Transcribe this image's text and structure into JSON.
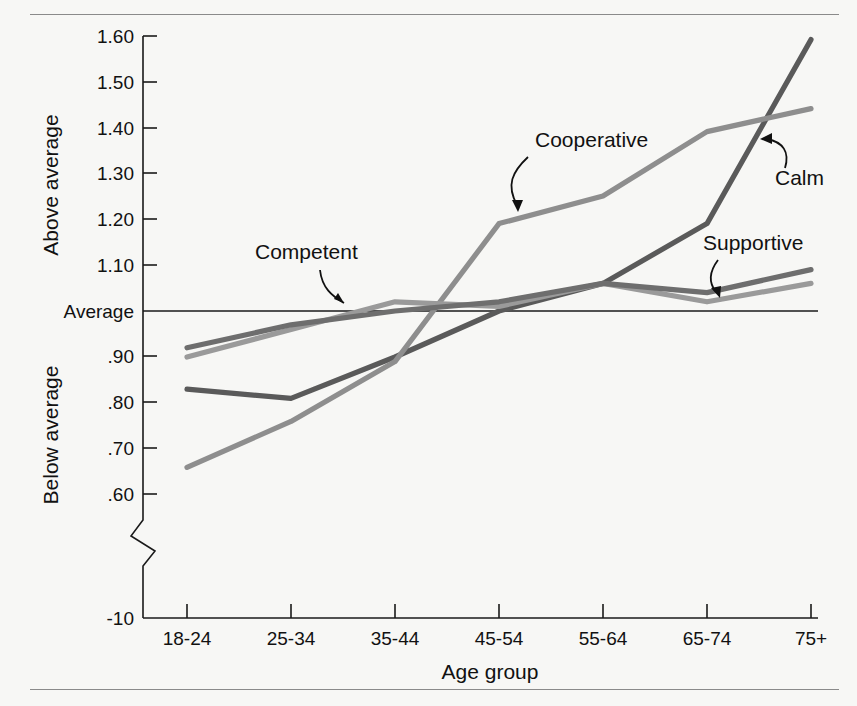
{
  "figure": {
    "background_color": "#f7f7f5",
    "rule_color": "#8a8a8a"
  },
  "chart_data": {
    "type": "line",
    "title": "",
    "subtitle": "",
    "xlabel": "Age group",
    "ylabel_upper": "Above average",
    "ylabel_lower": "Below average",
    "categories": [
      "18-24",
      "25-34",
      "35-44",
      "45-54",
      "55-64",
      "65-74",
      "75+"
    ],
    "x": [
      "18-24",
      "25-34",
      "35-44",
      "45-54",
      "55-64",
      "65-74",
      "75+"
    ],
    "y_ticks": [
      "1.60",
      "1.50",
      "1.40",
      "1.30",
      "1.20",
      "1.10",
      "Average",
      ".90",
      ".80",
      ".70",
      ".60",
      "-10"
    ],
    "y_tick_values": [
      1.6,
      1.5,
      1.4,
      1.3,
      1.2,
      1.1,
      1.0,
      0.9,
      0.8,
      0.7,
      0.6,
      -10
    ],
    "ylim": [
      0.55,
      1.62
    ],
    "axis_break": true,
    "axis_break_label": "-10",
    "reference_line": {
      "label": "Average",
      "value": 1.0
    },
    "grid": false,
    "legend_position": "inline-annotations",
    "series": [
      {
        "name": "Calm",
        "color": "#5a5a5a",
        "values": [
          0.83,
          0.81,
          0.9,
          1.0,
          1.06,
          1.19,
          1.59
        ]
      },
      {
        "name": "Cooperative",
        "color": "#8e8e8e",
        "values": [
          0.66,
          0.76,
          0.89,
          1.19,
          1.25,
          1.39,
          1.44
        ]
      },
      {
        "name": "Competent",
        "color": "#9a9a9a",
        "values": [
          0.9,
          0.96,
          1.02,
          1.01,
          1.06,
          1.02,
          1.06
        ]
      },
      {
        "name": "Supportive",
        "color": "#6e6e6e",
        "values": [
          0.92,
          0.97,
          1.0,
          1.02,
          1.06,
          1.04,
          1.09
        ]
      }
    ],
    "annotations": [
      {
        "label": "Competent",
        "target_series": "Competent"
      },
      {
        "label": "Cooperative",
        "target_series": "Cooperative"
      },
      {
        "label": "Calm",
        "target_series": "Calm"
      },
      {
        "label": "Supportive",
        "target_series": "Supportive"
      }
    ]
  }
}
